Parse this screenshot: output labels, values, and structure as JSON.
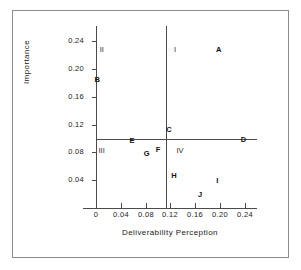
{
  "chart_data": {
    "type": "scatter",
    "title": "",
    "xlabel": "Deliverability Perception",
    "ylabel": "Importance",
    "xlim": [
      0,
      0.26
    ],
    "ylim": [
      0,
      0.262
    ],
    "grid": false,
    "legend": "none",
    "xticks": [
      "0",
      "0.04",
      "0.08",
      "0.12",
      "0.16",
      "0.20",
      "0.24"
    ],
    "xtick_values": [
      0,
      0.04,
      0.08,
      0.12,
      0.16,
      0.2,
      0.24
    ],
    "yticks": [
      "0.04",
      "0.08",
      "0.12",
      "0.16",
      "0.20",
      "0.24"
    ],
    "ytick_values": [
      0.04,
      0.08,
      0.12,
      0.16,
      0.2,
      0.24
    ],
    "point_labels": [
      "A",
      "B",
      "C",
      "D",
      "E",
      "F",
      "G",
      "H",
      "I",
      "J"
    ],
    "points": [
      {
        "label": "A",
        "x": 0.198,
        "y": 0.228
      },
      {
        "label": "B",
        "x": 0.002,
        "y": 0.184
      },
      {
        "label": "C",
        "x": 0.118,
        "y": 0.113
      },
      {
        "label": "D",
        "x": 0.238,
        "y": 0.098
      },
      {
        "label": "E",
        "x": 0.058,
        "y": 0.096
      },
      {
        "label": "F",
        "x": 0.1,
        "y": 0.083
      },
      {
        "label": "G",
        "x": 0.082,
        "y": 0.078
      },
      {
        "label": "H",
        "x": 0.126,
        "y": 0.046
      },
      {
        "label": "I",
        "x": 0.196,
        "y": 0.039
      },
      {
        "label": "J",
        "x": 0.168,
        "y": 0.019
      }
    ],
    "quadrant_divider_x": 0.122,
    "quadrant_divider_y": 0.093,
    "quadrants": [
      {
        "label": "I",
        "x": 0.126,
        "y": 0.228
      },
      {
        "label": "II",
        "x": 0.006,
        "y": 0.228
      },
      {
        "label": "III",
        "x": 0.004,
        "y": 0.082
      },
      {
        "label": "IV",
        "x": 0.13,
        "y": 0.082
      }
    ],
    "colors": {
      "background": "#ffffff",
      "axis": "#4a4a4a",
      "text": "#1a1a1a",
      "marker": "#111111",
      "frame": "#8a8a8a"
    }
  }
}
